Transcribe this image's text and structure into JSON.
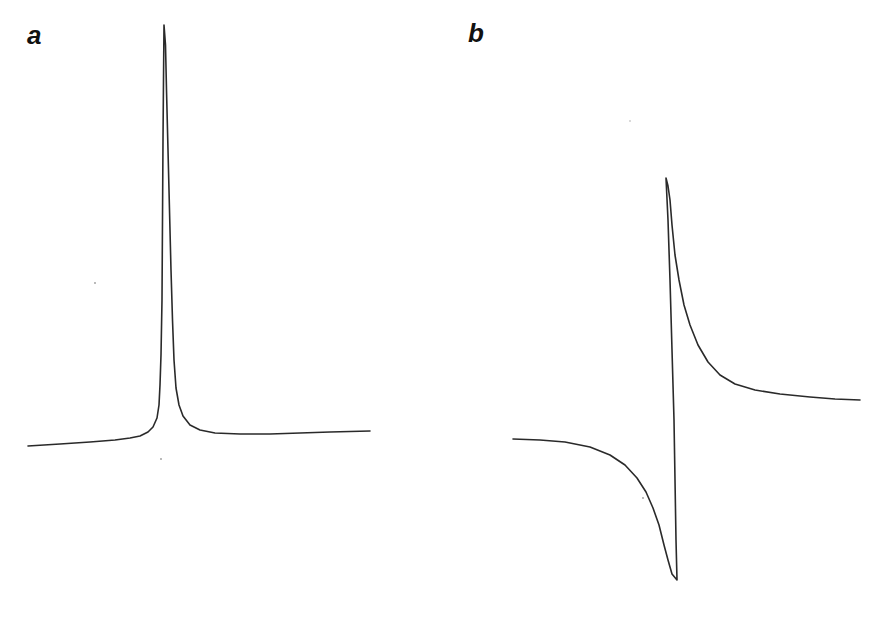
{
  "figure": {
    "panels": [
      {
        "label": "a"
      },
      {
        "label": "b"
      }
    ],
    "colors": {
      "trace": "#2a2a2a",
      "background": "#ffffff",
      "label": "#111111"
    }
  },
  "chart_data": [
    {
      "type": "line",
      "panel": "a",
      "title": "",
      "xlabel": "",
      "ylabel": "",
      "description": "Absorption line shape (single symmetric Lorentzian-like peak on a slightly sloped baseline)",
      "grid": false,
      "axes_visible": false,
      "pixel_geometry": {
        "baseline_left": [
          28,
          446
        ],
        "baseline_right": [
          370,
          431
        ],
        "peak": [
          164,
          25
        ],
        "center_x": 165,
        "half_width_px": 7,
        "tilt_px_per_px": -0.044
      },
      "series": [
        {
          "name": "absorption",
          "points_px": [
            [
              28,
              446
            ],
            [
              60,
              444
            ],
            [
              90,
              442
            ],
            [
              115,
              440
            ],
            [
              130,
              438
            ],
            [
              140,
              436
            ],
            [
              148,
              432
            ],
            [
              153,
              427
            ],
            [
              157,
              418
            ],
            [
              159,
              405
            ],
            [
              160,
              385
            ],
            [
              161,
              355
            ],
            [
              162,
              300
            ],
            [
              162.5,
              220
            ],
            [
              163,
              140
            ],
            [
              163.5,
              80
            ],
            [
              164,
              25
            ],
            [
              165.5,
              45
            ],
            [
              166.5,
              90
            ],
            [
              168,
              150
            ],
            [
              169.5,
              210
            ],
            [
              171,
              270
            ],
            [
              172.5,
              320
            ],
            [
              174,
              360
            ],
            [
              176,
              388
            ],
            [
              179,
              405
            ],
            [
              183,
              416
            ],
            [
              190,
              425
            ],
            [
              200,
              430
            ],
            [
              215,
              433
            ],
            [
              240,
              434
            ],
            [
              270,
              434
            ],
            [
              300,
              433
            ],
            [
              330,
              432
            ],
            [
              370,
              431
            ]
          ]
        }
      ]
    },
    {
      "type": "line",
      "panel": "b",
      "title": "",
      "xlabel": "",
      "ylabel": "",
      "description": "Dispersion line shape (antisymmetric, sharp positive peak and negative dip around zero crossing)",
      "grid": false,
      "axes_visible": false,
      "pixel_geometry": {
        "baseline_left": [
          513,
          439
        ],
        "baseline_right": [
          860,
          400
        ],
        "maximum": [
          666,
          178
        ],
        "minimum": [
          677,
          580
        ]
      },
      "series": [
        {
          "name": "dispersion",
          "points_px": [
            [
              513,
              439
            ],
            [
              540,
              440
            ],
            [
              565,
              442
            ],
            [
              590,
              447
            ],
            [
              610,
              455
            ],
            [
              625,
              465
            ],
            [
              637,
              478
            ],
            [
              646,
              492
            ],
            [
              653,
              508
            ],
            [
              659,
              525
            ],
            [
              664,
              545
            ],
            [
              668,
              560
            ],
            [
              672,
              574
            ],
            [
              677,
              580
            ],
            [
              676,
              540
            ],
            [
              675,
              480
            ],
            [
              674,
              420
            ],
            [
              672,
              350
            ],
            [
              670,
              280
            ],
            [
              668,
              220
            ],
            [
              666,
              178
            ],
            [
              668,
              186
            ],
            [
              670,
              200
            ],
            [
              672,
              225
            ],
            [
              675,
              255
            ],
            [
              679,
              280
            ],
            [
              684,
              305
            ],
            [
              690,
              325
            ],
            [
              698,
              345
            ],
            [
              708,
              362
            ],
            [
              720,
              375
            ],
            [
              735,
              384
            ],
            [
              755,
              390
            ],
            [
              780,
              394
            ],
            [
              810,
              397
            ],
            [
              835,
              399
            ],
            [
              860,
              400
            ]
          ]
        }
      ]
    }
  ]
}
